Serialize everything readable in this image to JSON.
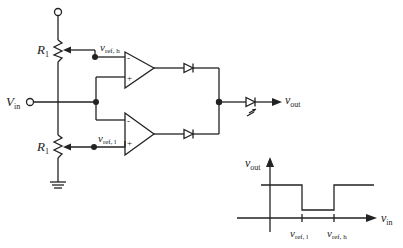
{
  "circuit": {
    "resistor_top": {
      "label": "R",
      "sub": "1"
    },
    "resistor_bottom": {
      "label": "R",
      "sub": "1"
    },
    "vref_high": {
      "label": "v",
      "sub": "ref, h"
    },
    "vref_low": {
      "label": "v",
      "sub": "ref, l"
    },
    "input": {
      "label": "V",
      "sub": "in"
    },
    "output": {
      "label": "v",
      "sub": "out"
    },
    "opamp_top": {
      "minus": "-",
      "plus": "+"
    },
    "opamp_bottom": {
      "minus": "-",
      "plus": "+"
    }
  },
  "graph": {
    "y_label": {
      "label": "v",
      "sub": "out"
    },
    "x_label": {
      "label": "v",
      "sub": "in"
    },
    "tick_low": {
      "label": "v",
      "sub": "ref, l"
    },
    "tick_high": {
      "label": "v",
      "sub": "ref, h"
    }
  },
  "colors": {
    "ink": "#222222",
    "background": "#ffffff"
  }
}
